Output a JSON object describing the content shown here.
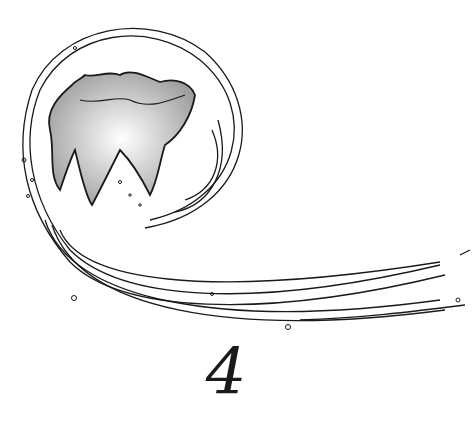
{
  "illustration": {
    "subject": "tooth-with-swirl",
    "page_number": "4",
    "colors": {
      "ink": "#1a1a1a",
      "shade": "#8a8a8a",
      "background": "#ffffff"
    }
  }
}
